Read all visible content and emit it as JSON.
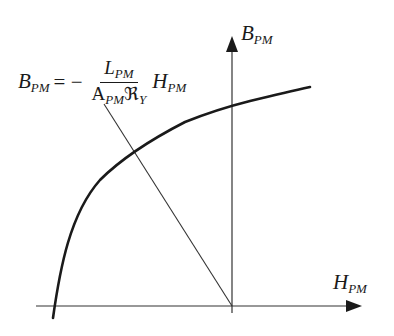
{
  "diagram": {
    "type": "magnetization_curve_with_load_line",
    "axes": {
      "x_label": {
        "main": "H",
        "sub": "PM"
      },
      "y_label": {
        "main": "B",
        "sub": "PM"
      },
      "origin_px": [
        232,
        306
      ]
    },
    "equation": {
      "lhs": {
        "main": "B",
        "sub": "PM"
      },
      "operator": "= −",
      "numerator": {
        "main": "L",
        "sub": "PM"
      },
      "denominator": {
        "main": "A",
        "sub": "PM",
        "symbol": "ℜ",
        "symbol_sub": "Y"
      },
      "rhs": {
        "main": "H",
        "sub": "PM"
      }
    },
    "elements": [
      {
        "id": "demagnetization-curve",
        "kind": "curve",
        "description": "B-H curve of permanent magnet, bold"
      },
      {
        "id": "load-line",
        "kind": "line",
        "description": "Load line through origin with negative slope"
      }
    ],
    "colors": {
      "stroke": "#1a1a1a",
      "axis": "#333333",
      "background": "#ffffff"
    }
  }
}
